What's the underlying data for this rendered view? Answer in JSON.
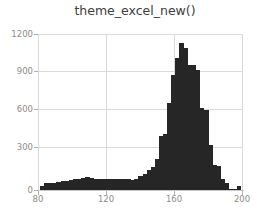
{
  "chart_data": {
    "type": "bar",
    "title": "theme_excel_new()",
    "xlabel": "",
    "ylabel": "",
    "xlim": [
      80,
      205
    ],
    "ylim": [
      0,
      1250
    ],
    "grid": true,
    "legend": null,
    "bar_color": "#262626",
    "grid_color": "#d9d9d9",
    "tick_label_color": "#8c8c8c",
    "title_color": "#404040",
    "xticks": [
      80,
      120,
      160,
      200
    ],
    "xtick_labels": [
      "80",
      "120",
      "160",
      "200"
    ],
    "yticks": [
      0,
      300,
      600,
      900,
      1200
    ],
    "ytick_labels": [
      "0",
      "300",
      "600",
      "900",
      "1200"
    ],
    "bin_width": 2.5,
    "x": [
      82.5,
      85,
      87.5,
      90,
      92.5,
      95,
      97.5,
      100,
      102.5,
      105,
      107.5,
      110,
      112.5,
      115,
      117.5,
      120,
      122.5,
      125,
      127.5,
      130,
      132.5,
      135,
      137.5,
      140,
      142.5,
      145,
      147.5,
      150,
      152.5,
      155,
      157.5,
      160,
      162.5,
      165,
      167.5,
      170,
      172.5,
      175,
      177.5,
      180,
      182.5,
      185,
      187.5,
      190,
      192.5,
      195,
      197.5,
      200,
      202.5
    ],
    "values": [
      30,
      55,
      55,
      60,
      65,
      70,
      75,
      80,
      85,
      90,
      100,
      105,
      100,
      85,
      85,
      90,
      85,
      85,
      85,
      85,
      85,
      85,
      80,
      90,
      110,
      130,
      160,
      185,
      250,
      430,
      450,
      700,
      920,
      1060,
      1180,
      1140,
      1000,
      1000,
      960,
      660,
      640,
      360,
      200,
      195,
      85,
      60,
      10,
      5,
      30
    ]
  }
}
